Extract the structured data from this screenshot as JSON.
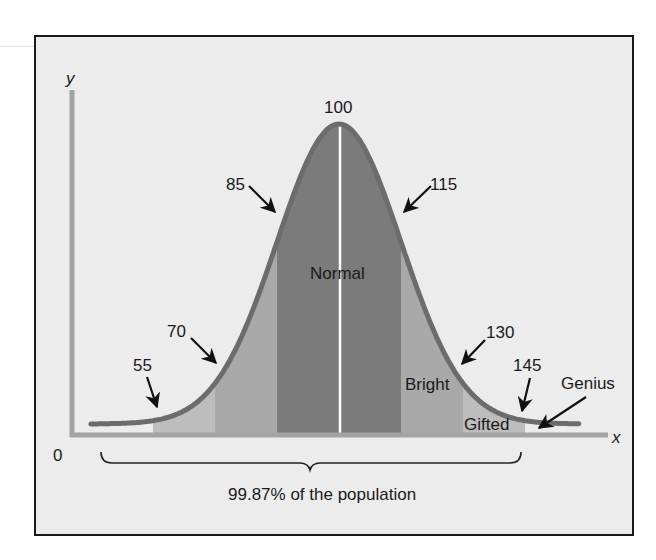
{
  "chart_data": {
    "type": "area",
    "title": "",
    "xlabel": "x",
    "ylabel": "y",
    "origin_label": "0",
    "mean": 100,
    "sd": 15,
    "tick_labels": [
      "55",
      "70",
      "85",
      "100",
      "115",
      "130",
      "145"
    ],
    "bands": [
      {
        "from": 55,
        "to": 70,
        "shade": "light"
      },
      {
        "from": 70,
        "to": 85,
        "shade": "medium"
      },
      {
        "from": 85,
        "to": 115,
        "shade": "dark",
        "label": "Normal"
      },
      {
        "from": 115,
        "to": 130,
        "shade": "medium",
        "label": "Bright"
      },
      {
        "from": 130,
        "to": 145,
        "shade": "light",
        "label": "Gifted"
      },
      {
        "from": 145,
        "to": 160,
        "shade": "none",
        "label": "Genius"
      }
    ],
    "annotations": [
      {
        "text": "99.87% of the population",
        "type": "brace",
        "from": 40,
        "to": 145
      }
    ],
    "grid": false,
    "legend": "none"
  },
  "labels": {
    "y_axis": "y",
    "x_axis": "x",
    "origin": "0",
    "v55": "55",
    "v70": "70",
    "v85": "85",
    "v100": "100",
    "v115": "115",
    "v130": "130",
    "v145": "145",
    "normal": "Normal",
    "bright": "Bright",
    "gifted": "Gifted",
    "genius": "Genius",
    "population": "99.87% of the population"
  },
  "colors": {
    "background": "#ececec",
    "frame": "#1a1a1a",
    "axis": "#a3a3a3",
    "curve": "#6c6c6c",
    "light": "#bdbdbd",
    "medium": "#a9a9a9",
    "dark": "#7b7b7b",
    "center_line": "#ffffff",
    "text": "#1a1a1a"
  }
}
